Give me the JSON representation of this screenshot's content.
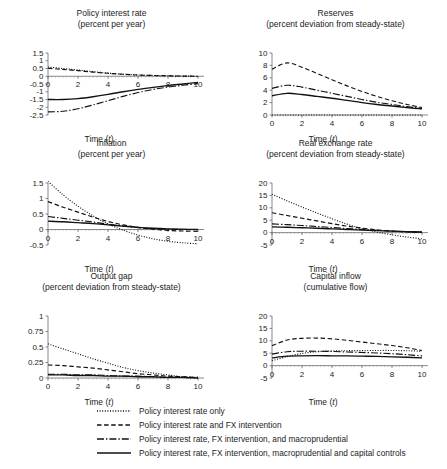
{
  "figure": {
    "xlabel": "Time (t)",
    "xlabel_plain": "Time",
    "xlabel_var": "t"
  },
  "legend": {
    "position": "bottom",
    "items": [
      {
        "style": "dotted",
        "label": "Policy interest rate only"
      },
      {
        "style": "dashed",
        "label": "Policy interest rate and FX intervention"
      },
      {
        "style": "dashdot",
        "label": "Policy interest rate, FX intervention, and macroprudential"
      },
      {
        "style": "solid",
        "label": "Policy interest rate, FX intervention, macroprudential and capital controls"
      }
    ]
  },
  "chart_data": [
    {
      "type": "line",
      "panel": "policy-interest-rate",
      "title": "Policy interest rate",
      "subtitle": "(percent per year)",
      "xlabel": "Time (t)",
      "ylabel": "",
      "xlim": [
        0,
        10
      ],
      "ylim": [
        -2.5,
        1.5
      ],
      "xticks": [
        0,
        2,
        4,
        6,
        8,
        10
      ],
      "yticks": [
        1.5,
        1,
        0.5,
        0,
        -0.5,
        -1,
        -1.5,
        -2,
        -2.5
      ],
      "ytick_labels": [
        "1.5",
        "1",
        "0.5",
        "0",
        "-0.5",
        "-1",
        "-1.5",
        "-2",
        "-2.5"
      ],
      "grid": false,
      "x": [
        0,
        1,
        2,
        3,
        4,
        5,
        6,
        7,
        8,
        9,
        10
      ],
      "series": [
        {
          "name": "Policy interest rate only",
          "style": "dotted",
          "values": [
            0.6,
            0.5,
            0.4,
            0.3,
            0.2,
            0.13,
            0.08,
            0.05,
            0.03,
            0.01,
            0.0
          ]
        },
        {
          "name": "Policy interest rate and FX intervention",
          "style": "dashed",
          "values": [
            0.52,
            0.44,
            0.36,
            0.27,
            0.19,
            0.13,
            0.08,
            0.05,
            0.03,
            0.01,
            0.0
          ]
        },
        {
          "name": "Policy interest rate, FX intervention, and macroprudential",
          "style": "dashdot",
          "values": [
            -2.3,
            -2.26,
            -2.1,
            -1.85,
            -1.58,
            -1.3,
            -1.05,
            -0.85,
            -0.7,
            -0.58,
            -0.48
          ]
        },
        {
          "name": "Policy interest rate, FX intervention, macroprudential and capital controls",
          "style": "solid",
          "values": [
            -1.5,
            -1.5,
            -1.44,
            -1.32,
            -1.17,
            -1.0,
            -0.85,
            -0.72,
            -0.6,
            -0.5,
            -0.4
          ]
        }
      ]
    },
    {
      "type": "line",
      "panel": "reserves",
      "title": "Reserves",
      "subtitle": "(percent deviation from steady-state)",
      "xlabel": "Time (t)",
      "ylabel": "",
      "xlim": [
        0,
        10
      ],
      "ylim": [
        0,
        10
      ],
      "xticks": [
        0,
        2,
        4,
        6,
        8,
        10
      ],
      "yticks": [
        10,
        8,
        6,
        4,
        2,
        0
      ],
      "ytick_labels": [
        "10",
        "8",
        "6",
        "4",
        "2",
        "0"
      ],
      "grid": false,
      "x": [
        0,
        1,
        2,
        3,
        4,
        5,
        6,
        7,
        8,
        9,
        10
      ],
      "series": [
        {
          "name": "Policy interest rate only",
          "style": "dotted",
          "values": [
            0,
            0,
            0,
            0,
            0,
            0,
            0,
            0,
            0,
            0,
            0
          ]
        },
        {
          "name": "Policy interest rate and FX intervention",
          "style": "dashed",
          "values": [
            7.4,
            8.4,
            7.7,
            6.7,
            5.7,
            4.7,
            3.8,
            3.0,
            2.3,
            1.7,
            1.2
          ]
        },
        {
          "name": "Policy interest rate, FX intervention, and macroprudential",
          "style": "dashdot",
          "values": [
            4.3,
            4.8,
            4.5,
            4.0,
            3.5,
            3.0,
            2.5,
            2.05,
            1.7,
            1.35,
            1.05
          ]
        },
        {
          "name": "Policy interest rate, FX intervention, macroprudential and capital controls",
          "style": "solid",
          "values": [
            3.1,
            3.5,
            3.3,
            3.0,
            2.7,
            2.35,
            2.0,
            1.7,
            1.45,
            1.2,
            1.0
          ]
        }
      ]
    },
    {
      "type": "line",
      "panel": "inflation",
      "title": "Inflation",
      "subtitle": "(percent per year)",
      "xlabel": "Time (t)",
      "ylabel": "",
      "xlim": [
        0,
        10
      ],
      "ylim": [
        -0.5,
        1.5
      ],
      "xticks": [
        0,
        2,
        4,
        6,
        8,
        10
      ],
      "yticks": [
        1.5,
        1,
        0.5,
        0,
        -0.5
      ],
      "ytick_labels": [
        "1.5",
        "1",
        "0.5",
        "0",
        "-0.5"
      ],
      "grid": false,
      "x": [
        0,
        1,
        2,
        3,
        4,
        5,
        6,
        7,
        8,
        9,
        10
      ],
      "series": [
        {
          "name": "Policy interest rate only",
          "style": "dotted",
          "values": [
            1.55,
            1.12,
            0.75,
            0.44,
            0.18,
            -0.02,
            -0.18,
            -0.3,
            -0.38,
            -0.43,
            -0.46
          ]
        },
        {
          "name": "Policy interest rate and FX intervention",
          "style": "dashed",
          "values": [
            0.9,
            0.72,
            0.56,
            0.4,
            0.26,
            0.15,
            0.07,
            0.01,
            -0.03,
            -0.05,
            -0.06
          ]
        },
        {
          "name": "Policy interest rate, FX intervention, and macroprudential",
          "style": "dashdot",
          "values": [
            0.42,
            0.36,
            0.3,
            0.24,
            0.17,
            0.11,
            0.06,
            0.03,
            0.01,
            0.0,
            0.0
          ]
        },
        {
          "name": "Policy interest rate, FX intervention, macroprudential and capital controls",
          "style": "solid",
          "values": [
            0.27,
            0.25,
            0.22,
            0.19,
            0.15,
            0.11,
            0.07,
            0.04,
            0.02,
            0.01,
            0.0
          ]
        }
      ]
    },
    {
      "type": "line",
      "panel": "real-exchange-rate",
      "title": "Real exchange rate",
      "subtitle": "(percent deviation from steady-state)",
      "xlabel": "Time (t)",
      "ylabel": "",
      "xlim": [
        0,
        10
      ],
      "ylim": [
        -5,
        20
      ],
      "xticks": [
        0,
        2,
        4,
        6,
        8,
        10
      ],
      "yticks": [
        20,
        15,
        10,
        5,
        0,
        -5
      ],
      "ytick_labels": [
        "20",
        "15",
        "10",
        "5",
        "0",
        "-5"
      ],
      "grid": false,
      "x": [
        0,
        1,
        2,
        3,
        4,
        5,
        6,
        7,
        8,
        9,
        10
      ],
      "series": [
        {
          "name": "Policy interest rate only",
          "style": "dotted",
          "values": [
            15.5,
            12.8,
            10.3,
            7.9,
            5.6,
            3.4,
            1.6,
            0.2,
            -0.9,
            -1.8,
            -2.5
          ]
        },
        {
          "name": "Policy interest rate and FX intervention",
          "style": "dashed",
          "values": [
            8.0,
            6.9,
            5.8,
            4.7,
            3.6,
            2.6,
            1.8,
            1.1,
            0.6,
            0.25,
            0.05
          ]
        },
        {
          "name": "Policy interest rate, FX intervention, and macroprudential",
          "style": "dashdot",
          "values": [
            3.5,
            3.2,
            2.85,
            2.45,
            2.05,
            1.65,
            1.25,
            0.9,
            0.6,
            0.35,
            0.15
          ]
        },
        {
          "name": "Policy interest rate, FX intervention, macroprudential and capital controls",
          "style": "solid",
          "values": [
            2.3,
            2.15,
            1.95,
            1.75,
            1.5,
            1.25,
            1.0,
            0.78,
            0.58,
            0.4,
            0.25
          ]
        }
      ]
    },
    {
      "type": "line",
      "panel": "output-gap",
      "title": "Output gap",
      "subtitle": "(percent deviation from steady-state)",
      "xlabel": "Time (t)",
      "ylabel": "",
      "xlim": [
        0,
        10
      ],
      "ylim": [
        0,
        1
      ],
      "xticks": [
        0,
        2,
        4,
        6,
        8,
        10
      ],
      "yticks": [
        1,
        0.75,
        0.5,
        0.25,
        0
      ],
      "ytick_labels": [
        "1",
        "0.75",
        "0.5",
        "0.25",
        "0"
      ],
      "grid": false,
      "x": [
        0,
        1,
        2,
        3,
        4,
        5,
        6,
        7,
        8,
        9,
        10
      ],
      "series": [
        {
          "name": "Policy interest rate only",
          "style": "dotted",
          "values": [
            0.55,
            0.47,
            0.39,
            0.31,
            0.24,
            0.17,
            0.12,
            0.08,
            0.05,
            0.02,
            0.01
          ]
        },
        {
          "name": "Policy interest rate and FX intervention",
          "style": "dashed",
          "values": [
            0.21,
            0.2,
            0.18,
            0.16,
            0.13,
            0.1,
            0.07,
            0.05,
            0.03,
            0.02,
            0.01
          ]
        },
        {
          "name": "Policy interest rate, FX intervention, and macroprudential",
          "style": "dashdot",
          "values": [
            0.06,
            0.06,
            0.05,
            0.05,
            0.04,
            0.03,
            0.03,
            0.02,
            0.01,
            0.01,
            0.0
          ]
        },
        {
          "name": "Policy interest rate, FX intervention, macroprudential and capital controls",
          "style": "solid",
          "values": [
            0.05,
            0.05,
            0.04,
            0.04,
            0.03,
            0.03,
            0.02,
            0.02,
            0.01,
            0.01,
            0.0
          ]
        }
      ]
    },
    {
      "type": "line",
      "panel": "capital-inflow",
      "title": "Capital inflow",
      "subtitle": "(cumulative flow)",
      "xlabel": "Time (t)",
      "ylabel": "",
      "xlim": [
        0,
        10
      ],
      "ylim": [
        -5,
        20
      ],
      "xticks": [
        0,
        2,
        4,
        6,
        8,
        10
      ],
      "yticks": [
        20,
        15,
        10,
        5,
        0,
        -5
      ],
      "ytick_labels": [
        "20",
        "15",
        "10",
        "5",
        "0",
        "-5"
      ],
      "grid": false,
      "x": [
        0,
        1,
        2,
        3,
        4,
        5,
        6,
        7,
        8,
        9,
        10
      ],
      "series": [
        {
          "name": "Policy interest rate only",
          "style": "dotted",
          "values": [
            2.0,
            3.6,
            4.9,
            5.6,
            5.9,
            6.0,
            6.05,
            6.1,
            6.1,
            6.0,
            5.8
          ]
        },
        {
          "name": "Policy interest rate and FX intervention",
          "style": "dashed",
          "values": [
            8.0,
            10.3,
            11.0,
            11.1,
            10.8,
            10.2,
            9.5,
            8.8,
            8.1,
            7.2,
            6.1
          ]
        },
        {
          "name": "Policy interest rate, FX intervention, and macroprudential",
          "style": "dashdot",
          "values": [
            4.6,
            5.6,
            5.8,
            5.8,
            5.7,
            5.5,
            5.3,
            5.1,
            4.8,
            4.4,
            3.9
          ]
        },
        {
          "name": "Policy interest rate, FX intervention, macroprudential and capital controls",
          "style": "solid",
          "values": [
            3.1,
            3.8,
            3.95,
            4.0,
            3.95,
            3.9,
            3.8,
            3.7,
            3.55,
            3.35,
            3.1
          ]
        }
      ]
    }
  ]
}
